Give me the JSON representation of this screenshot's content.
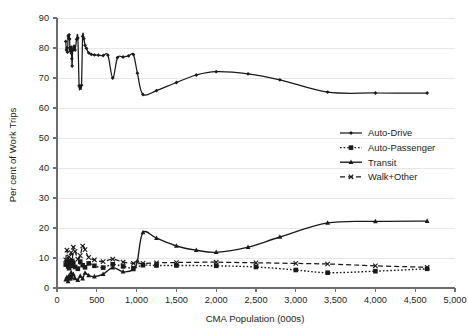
{
  "chart_data": {
    "type": "line",
    "title": "",
    "xlabel": "CMA Population (000s)",
    "ylabel": "Per cent of Work Trips",
    "xlim": [
      0,
      5000
    ],
    "ylim": [
      0,
      90
    ],
    "xticks": [
      0,
      500,
      1000,
      1500,
      2000,
      2500,
      3000,
      3500,
      4000,
      4500,
      5000
    ],
    "xticklabels": [
      "0",
      "500",
      "1,000",
      "1,500",
      "2,000",
      "2,500",
      "3,000",
      "3,500",
      "4,000",
      "4,500",
      "5,000"
    ],
    "yticks": [
      0,
      10,
      20,
      30,
      40,
      50,
      60,
      70,
      80,
      90
    ],
    "yticklabels": [
      "0",
      "10",
      "20",
      "30",
      "40",
      "50",
      "60",
      "70",
      "80",
      "90"
    ],
    "grid": "horizontal",
    "legend_position": "center-right",
    "series": [
      {
        "name": "Auto-Drive",
        "marker": "diamond",
        "linestyle": "solid",
        "color": "#1a1a1a",
        "points": [
          [
            110,
            82.2
          ],
          [
            118,
            79.3
          ],
          [
            125,
            80.0
          ],
          [
            132,
            78.6
          ],
          [
            140,
            84.0
          ],
          [
            146,
            83.2
          ],
          [
            152,
            84.4
          ],
          [
            158,
            83.0
          ],
          [
            162,
            80.1
          ],
          [
            166,
            79.4
          ],
          [
            170,
            78.9
          ],
          [
            174,
            79.6
          ],
          [
            178,
            80.3
          ],
          [
            182,
            78.2
          ],
          [
            186,
            76.4
          ],
          [
            190,
            74.0
          ],
          [
            196,
            79.1
          ],
          [
            205,
            79.8
          ],
          [
            215,
            80.6
          ],
          [
            228,
            79.3
          ],
          [
            246,
            82.9
          ],
          [
            262,
            83.3
          ],
          [
            278,
            67.4
          ],
          [
            292,
            67.0
          ],
          [
            308,
            67.6
          ],
          [
            322,
            83.9
          ],
          [
            338,
            83.1
          ],
          [
            352,
            80.9
          ],
          [
            370,
            79.9
          ],
          [
            398,
            78.4
          ],
          [
            430,
            77.9
          ],
          [
            470,
            77.7
          ],
          [
            520,
            77.6
          ],
          [
            580,
            77.5
          ],
          [
            640,
            77.6
          ],
          [
            700,
            70.0
          ],
          [
            760,
            76.8
          ],
          [
            830,
            77.0
          ],
          [
            900,
            77.4
          ],
          [
            960,
            77.8
          ],
          [
            1010,
            71.6
          ],
          [
            1080,
            64.5
          ],
          [
            1250,
            65.8
          ],
          [
            1500,
            68.5
          ],
          [
            1750,
            71.0
          ],
          [
            2000,
            72.1
          ],
          [
            2400,
            71.4
          ],
          [
            2800,
            69.4
          ],
          [
            3400,
            65.3
          ],
          [
            4000,
            65.0
          ],
          [
            4650,
            65.0
          ]
        ]
      },
      {
        "name": "Auto-Passenger",
        "marker": "square",
        "linestyle": "dotted",
        "color": "#1a1a1a",
        "points": [
          [
            110,
            7.8
          ],
          [
            125,
            8.6
          ],
          [
            140,
            7.2
          ],
          [
            152,
            6.6
          ],
          [
            166,
            8.1
          ],
          [
            178,
            7.4
          ],
          [
            190,
            9.0
          ],
          [
            205,
            8.3
          ],
          [
            228,
            7.0
          ],
          [
            262,
            6.4
          ],
          [
            292,
            8.8
          ],
          [
            322,
            7.6
          ],
          [
            352,
            6.9
          ],
          [
            398,
            8.2
          ],
          [
            470,
            7.4
          ],
          [
            580,
            6.8
          ],
          [
            700,
            7.9
          ],
          [
            830,
            7.2
          ],
          [
            960,
            6.6
          ],
          [
            1080,
            7.6
          ],
          [
            1250,
            7.5
          ],
          [
            1500,
            7.5
          ],
          [
            2000,
            7.4
          ],
          [
            2500,
            7.0
          ],
          [
            3000,
            6.0
          ],
          [
            3400,
            5.1
          ],
          [
            4000,
            5.6
          ],
          [
            4650,
            6.4
          ]
        ]
      },
      {
        "name": "Transit",
        "marker": "triangle",
        "linestyle": "solid",
        "color": "#1a1a1a",
        "points": [
          [
            110,
            2.8
          ],
          [
            125,
            3.6
          ],
          [
            140,
            2.2
          ],
          [
            152,
            4.1
          ],
          [
            166,
            3.0
          ],
          [
            178,
            5.2
          ],
          [
            190,
            3.4
          ],
          [
            205,
            4.6
          ],
          [
            228,
            3.2
          ],
          [
            262,
            2.6
          ],
          [
            292,
            4.0
          ],
          [
            322,
            3.1
          ],
          [
            352,
            5.0
          ],
          [
            398,
            4.2
          ],
          [
            470,
            3.8
          ],
          [
            580,
            4.6
          ],
          [
            700,
            6.8
          ],
          [
            830,
            5.4
          ],
          [
            960,
            6.2
          ],
          [
            1010,
            9.0
          ],
          [
            1080,
            18.5
          ],
          [
            1250,
            16.6
          ],
          [
            1500,
            14.0
          ],
          [
            1750,
            12.6
          ],
          [
            2000,
            11.9
          ],
          [
            2400,
            13.6
          ],
          [
            2800,
            17.0
          ],
          [
            3400,
            21.7
          ],
          [
            4000,
            22.2
          ],
          [
            4650,
            22.3
          ]
        ]
      },
      {
        "name": "Walk+Other",
        "marker": "x",
        "linestyle": "dashed",
        "color": "#1a1a1a",
        "points": [
          [
            110,
            9.4
          ],
          [
            125,
            12.6
          ],
          [
            140,
            8.2
          ],
          [
            152,
            10.4
          ],
          [
            166,
            9.0
          ],
          [
            178,
            11.8
          ],
          [
            190,
            8.6
          ],
          [
            205,
            13.6
          ],
          [
            228,
            12.2
          ],
          [
            262,
            9.6
          ],
          [
            292,
            10.8
          ],
          [
            322,
            14.0
          ],
          [
            352,
            12.8
          ],
          [
            398,
            10.2
          ],
          [
            470,
            9.4
          ],
          [
            580,
            8.8
          ],
          [
            700,
            9.6
          ],
          [
            830,
            8.6
          ],
          [
            960,
            8.2
          ],
          [
            1080,
            8.2
          ],
          [
            1250,
            8.4
          ],
          [
            1500,
            8.5
          ],
          [
            2000,
            8.6
          ],
          [
            2500,
            8.4
          ],
          [
            3000,
            8.2
          ],
          [
            3400,
            8.0
          ],
          [
            4000,
            7.4
          ],
          [
            4650,
            6.9
          ]
        ]
      }
    ]
  },
  "legend": {
    "items": [
      {
        "label": "Auto-Drive"
      },
      {
        "label": "Auto-Passenger"
      },
      {
        "label": "Transit"
      },
      {
        "label": "Walk+Other"
      }
    ]
  }
}
